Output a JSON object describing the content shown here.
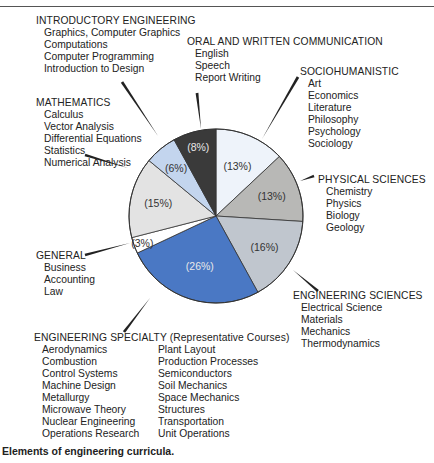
{
  "chart_data": {
    "type": "pie",
    "title": "",
    "caption": "Elements of engineering curricula.",
    "slices": [
      {
        "name": "Sociohumanistic",
        "value": 13,
        "label": "(13%)",
        "color": "#eef3fa"
      },
      {
        "name": "Physical Sciences",
        "value": 13,
        "label": "(13%)",
        "color": "#b8b8b6"
      },
      {
        "name": "Engineering Sciences",
        "value": 16,
        "label": "(16%)",
        "color": "#c0c6ce"
      },
      {
        "name": "Engineering Specialty",
        "value": 26,
        "label": "(26%)",
        "color": "#4a78c4"
      },
      {
        "name": "General",
        "value": 3,
        "label": "(3%)",
        "color": "#ffffff"
      },
      {
        "name": "Mathematics",
        "value": 15,
        "label": "(15%)",
        "color": "#e3e3e3"
      },
      {
        "name": "Introductory Engineering",
        "value": 6,
        "label": "(6%)",
        "color": "#c3d5ee"
      },
      {
        "name": "Oral and Written Communication",
        "value": 8,
        "label": "(8%)",
        "color": "#3a3a3a"
      }
    ]
  },
  "groups": {
    "intro": {
      "title": "INTRODUCTORY ENGINEERING",
      "items": [
        "Graphics, Computer Graphics",
        "Computations",
        "Computer Programming",
        "Introduction to Design"
      ]
    },
    "oral": {
      "title": "ORAL AND WRITTEN COMMUNICATION",
      "items": [
        "English",
        "Speech",
        "Report Writing"
      ]
    },
    "socio": {
      "title": "SOCIOHUMANISTIC",
      "items": [
        "Art",
        "Economics",
        "Literature",
        "Philosophy",
        "Psychology",
        "Sociology"
      ]
    },
    "math": {
      "title": "MATHEMATICS",
      "items": [
        "Calculus",
        "Vector Analysis",
        "Differential Equations",
        "Statistics",
        "Numerical Analysis"
      ]
    },
    "phys": {
      "title": "PHYSICAL SCIENCES",
      "items": [
        "Chemistry",
        "Physics",
        "Biology",
        "Geology"
      ]
    },
    "general": {
      "title": "GENERAL",
      "items": [
        "Business",
        "Accounting",
        "Law"
      ]
    },
    "engsci": {
      "title": "ENGINEERING SCIENCES",
      "items": [
        "Electrical Science",
        "Materials",
        "Mechanics",
        "Thermodynamics"
      ]
    },
    "specialty": {
      "title": "ENGINEERING SPECIALTY (Representative Courses)",
      "col1": [
        "Aerodynamics",
        "Combustion",
        "Control Systems",
        "Machine Design",
        "Metallurgy",
        "Microwave Theory",
        "Nuclear Engineering",
        "Operations Research"
      ],
      "col2": [
        "Plant Layout",
        "Production Processes",
        "Semiconductors",
        "Soil Mechanics",
        "Space Mechanics",
        "Structures",
        "Transportation",
        "Unit Operations"
      ]
    }
  },
  "caption": "Elements of engineering curricula."
}
